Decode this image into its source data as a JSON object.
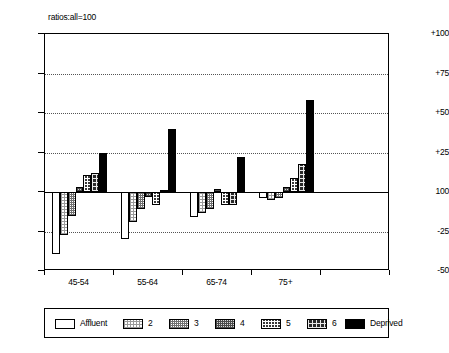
{
  "chart_data": {
    "type": "bar",
    "title": "ratios:all=100",
    "xlabel": "",
    "ylabel": "",
    "grid": true,
    "legend_position": "bottom",
    "baseline": 100,
    "ylim": [
      -50,
      100
    ],
    "ytick_labels": [
      "+100",
      "+75",
      "+50",
      "+25",
      "100",
      "-25",
      "-50"
    ],
    "ytick_values": [
      100,
      75,
      50,
      25,
      0,
      -25,
      -50
    ],
    "categories": [
      "45-54",
      "55-64",
      "65-74",
      "75+"
    ],
    "series": [
      {
        "name": "Affluent",
        "values": [
          -39,
          -30,
          -16,
          -4
        ]
      },
      {
        "name": "2",
        "values": [
          -27,
          -19,
          -13,
          -5
        ]
      },
      {
        "name": "3",
        "values": [
          -15,
          -11,
          -11,
          -4
        ]
      },
      {
        "name": "4",
        "values": [
          3,
          -3,
          2,
          3
        ]
      },
      {
        "name": "5",
        "values": [
          11,
          -8,
          -8,
          9
        ]
      },
      {
        "name": "6",
        "values": [
          12,
          1,
          -8,
          18
        ]
      },
      {
        "name": "Deprived",
        "values": [
          25,
          40,
          22,
          58
        ]
      }
    ]
  },
  "legend": {
    "entries": [
      {
        "label": "Affluent"
      },
      {
        "label": "2"
      },
      {
        "label": "3"
      },
      {
        "label": "4"
      },
      {
        "label": "5"
      },
      {
        "label": "6"
      },
      {
        "label": "Deprived"
      }
    ]
  },
  "colors": {
    "axis": "#000000",
    "grid": "#555555",
    "background": "#ffffff"
  }
}
